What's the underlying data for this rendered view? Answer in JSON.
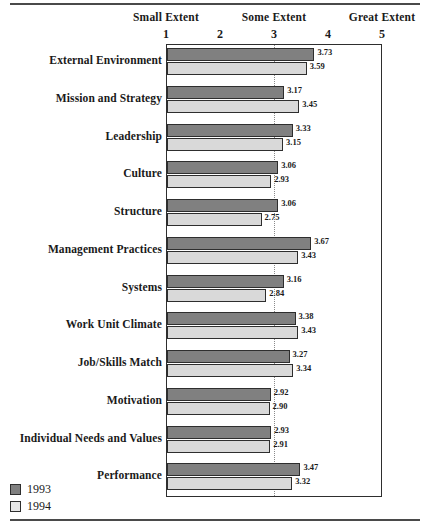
{
  "chart_data": {
    "type": "bar",
    "orientation": "horizontal",
    "title": "",
    "xlabel": "",
    "ylabel": "",
    "xlim": [
      1,
      5
    ],
    "xticks": [
      1,
      2,
      3,
      4,
      5
    ],
    "xtick_labels": [
      "1",
      "2",
      "3",
      "4",
      "5"
    ],
    "axis_captions": [
      {
        "text": "Small Extent",
        "at": 1
      },
      {
        "text": "Some Extent",
        "at": 3
      },
      {
        "text": "Great Extent",
        "at": 5
      }
    ],
    "grid": {
      "vertical_at": [
        3
      ],
      "style": "dotted"
    },
    "legend": {
      "position": "bottom-left",
      "entries": [
        "1993",
        "1994"
      ]
    },
    "categories": [
      "External Environment",
      "Mission and Strategy",
      "Leadership",
      "Culture",
      "Structure",
      "Management Practices",
      "Systems",
      "Work Unit Climate",
      "Job/Skills Match",
      "Motivation",
      "Individual Needs and Values",
      "Performance"
    ],
    "series": [
      {
        "name": "1993",
        "color": "#808080",
        "values": [
          3.73,
          3.17,
          3.33,
          3.06,
          3.06,
          3.67,
          3.16,
          3.38,
          3.27,
          2.92,
          2.93,
          3.47
        ]
      },
      {
        "name": "1994",
        "color": "#d9d9d9",
        "values": [
          3.59,
          3.45,
          3.15,
          2.93,
          2.75,
          3.43,
          2.84,
          3.43,
          3.34,
          2.9,
          2.91,
          3.32
        ]
      }
    ],
    "value_labels": {
      "1993": [
        "3.73",
        "3.17",
        "3.33",
        "3.06",
        "3.06",
        "3.67",
        "3.16",
        "3.38",
        "3.27",
        "2.92",
        "2.93",
        "3.47"
      ],
      "1994": [
        "3.59",
        "3.45",
        "3.15",
        "2.93",
        "2.75",
        "3.43",
        "2.84",
        "3.43",
        "3.34",
        "2.90",
        "2.91",
        "3.32"
      ]
    }
  },
  "legend": {
    "items": [
      {
        "label": "1993",
        "color": "#808080"
      },
      {
        "label": "1994",
        "color": "#e6e6e6"
      }
    ]
  }
}
